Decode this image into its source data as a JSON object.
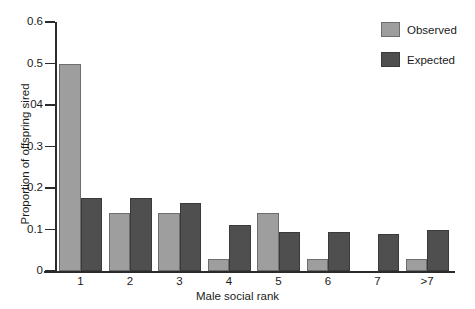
{
  "chart_data": {
    "type": "bar",
    "title": "",
    "xlabel": "Male social rank",
    "ylabel": "Proportion of offspring sired",
    "categories": [
      "1",
      "2",
      "3",
      "4",
      "5",
      "6",
      "7",
      ">7"
    ],
    "series": [
      {
        "name": "Observed",
        "color": "#9e9e9e",
        "values": [
          0.5,
          0.14,
          0.14,
          0.03,
          0.14,
          0.03,
          0.0,
          0.03
        ]
      },
      {
        "name": "Expected",
        "color": "#4f4f4f",
        "values": [
          0.175,
          0.175,
          0.165,
          0.11,
          0.095,
          0.095,
          0.09,
          0.1
        ]
      }
    ],
    "ylim": [
      0,
      0.6
    ],
    "ytick_values": [
      0.6,
      0.5,
      0.4,
      0.3,
      0.2,
      0.1,
      0
    ],
    "ytick_labels": [
      "0.6",
      "0.5",
      "04",
      "0.3",
      "0.2",
      "0.1",
      "0"
    ],
    "grid": false,
    "legend_position": "top-right",
    "legend": [
      "Observed",
      "Expected"
    ]
  },
  "axes": {
    "y_title": "Proportion of offspring sired",
    "x_title": "Male social rank"
  }
}
